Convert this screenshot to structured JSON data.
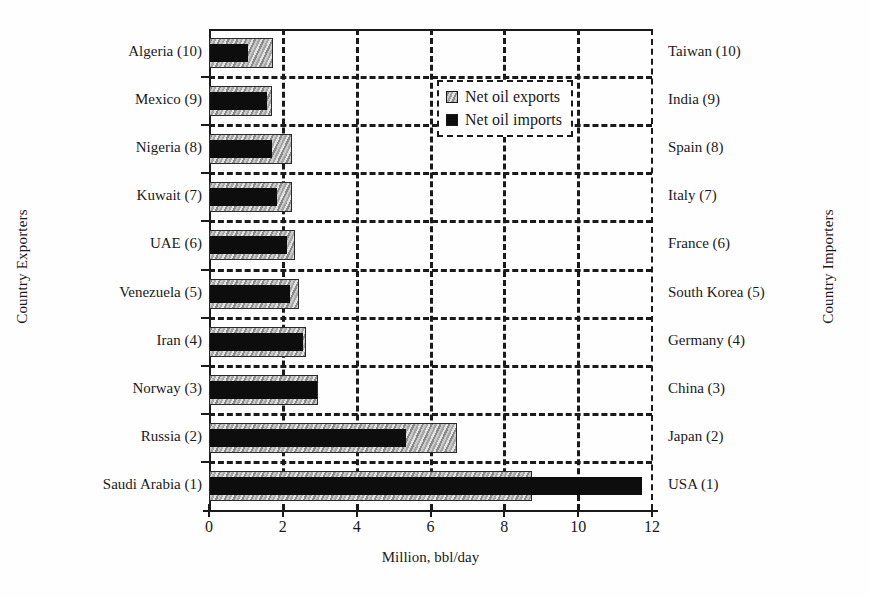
{
  "figure": {
    "x_axis_title": "Million, bbl/day",
    "y_left_title": "Country Exporters",
    "y_right_title": "Country Importers"
  },
  "legend": {
    "position": "inside-top-center",
    "entries": [
      {
        "label": "Net oil exports",
        "swatch": "gray-hatched",
        "color": "#a5a5a5"
      },
      {
        "label": "Net oil imports",
        "swatch": "black-solid",
        "color": "#0d0d0d"
      }
    ]
  },
  "axis": {
    "x_ticks": [
      "0",
      "2",
      "4",
      "6",
      "8",
      "10",
      "12"
    ],
    "x_tick_values": [
      0,
      2,
      4,
      6,
      8,
      10,
      12
    ],
    "x_min": 0,
    "x_max": 12
  },
  "chart_data": {
    "type": "bar",
    "orientation": "horizontal",
    "title": "",
    "subtitle": "",
    "xlabel": "Million, bbl/day",
    "ylabel": "Country Exporters",
    "ylabel_right": "Country Importers",
    "xlim": [
      0,
      12
    ],
    "grid": "dashed-both-axes",
    "legend_position": "inside top center",
    "categories_left": [
      "Algeria (10)",
      "Mexico (9)",
      "Nigeria (8)",
      "Kuwait (7)",
      "UAE (6)",
      "Venezuela (5)",
      "Iran (4)",
      "Norway (3)",
      "Russia (2)",
      "Saudi Arabia (1)"
    ],
    "categories_right": [
      "Taiwan (10)",
      "India (9)",
      "Spain (8)",
      "Italy (7)",
      "France (6)",
      "South Korea (5)",
      "Germany (4)",
      "China (3)",
      "Japan (2)",
      "USA (1)"
    ],
    "series": [
      {
        "name": "Net oil exports",
        "color": "#a5a5a5",
        "values": [
          1.73,
          1.71,
          2.25,
          2.25,
          2.33,
          2.44,
          2.63,
          2.96,
          6.72,
          8.75
        ]
      },
      {
        "name": "Net oil imports",
        "color": "#0d0d0d",
        "values": [
          1.08,
          1.6,
          1.73,
          1.86,
          2.15,
          2.22,
          2.57,
          2.94,
          5.37,
          11.76
        ]
      }
    ],
    "rows": [
      {
        "exporter": "Algeria (10)",
        "importer": "Taiwan (10)",
        "net_oil_exports": 1.73,
        "net_oil_imports": 1.08
      },
      {
        "exporter": "Mexico (9)",
        "importer": "India (9)",
        "net_oil_exports": 1.71,
        "net_oil_imports": 1.6
      },
      {
        "exporter": "Nigeria (8)",
        "importer": "Spain (8)",
        "net_oil_exports": 2.25,
        "net_oil_imports": 1.73
      },
      {
        "exporter": "Kuwait (7)",
        "importer": "Italy (7)",
        "net_oil_exports": 2.25,
        "net_oil_imports": 1.86
      },
      {
        "exporter": "UAE (6)",
        "importer": "France (6)",
        "net_oil_exports": 2.33,
        "net_oil_imports": 2.15
      },
      {
        "exporter": "Venezuela (5)",
        "importer": "South Korea (5)",
        "net_oil_exports": 2.44,
        "net_oil_imports": 2.22
      },
      {
        "exporter": "Iran (4)",
        "importer": "Germany (4)",
        "net_oil_exports": 2.63,
        "net_oil_imports": 2.57
      },
      {
        "exporter": "Norway (3)",
        "importer": "China (3)",
        "net_oil_exports": 2.96,
        "net_oil_imports": 2.94
      },
      {
        "exporter": "Russia (2)",
        "importer": "Japan (2)",
        "net_oil_exports": 6.72,
        "net_oil_imports": 5.37
      },
      {
        "exporter": "Saudi Arabia (1)",
        "importer": "USA (1)",
        "net_oil_exports": 8.75,
        "net_oil_imports": 11.76
      }
    ]
  }
}
